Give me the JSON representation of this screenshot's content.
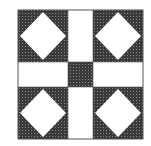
{
  "figure": {
    "pattern": "nine-patch with square-in-a-square corners",
    "colors": {
      "background": "#ffffff",
      "dark_fabric": "#3a3a3a",
      "dark_fabric_dots": "#8a8a8a",
      "light_fabric": "#ffffff",
      "outline": "#555555"
    },
    "layout": {
      "block": {
        "x": 18,
        "y": 10,
        "w": 125,
        "h": 129
      },
      "sash_x": [
        68,
        93
      ],
      "sash_y": [
        62,
        87
      ]
    },
    "corner_units": [
      {
        "position": "top-left",
        "x": 18,
        "y": 10,
        "w": 50,
        "h": 52
      },
      {
        "position": "top-right",
        "x": 93,
        "y": 10,
        "w": 50,
        "h": 52
      },
      {
        "position": "bottom-left",
        "x": 18,
        "y": 87,
        "w": 50,
        "h": 52
      },
      {
        "position": "bottom-right",
        "x": 93,
        "y": 87,
        "w": 50,
        "h": 52
      }
    ]
  }
}
